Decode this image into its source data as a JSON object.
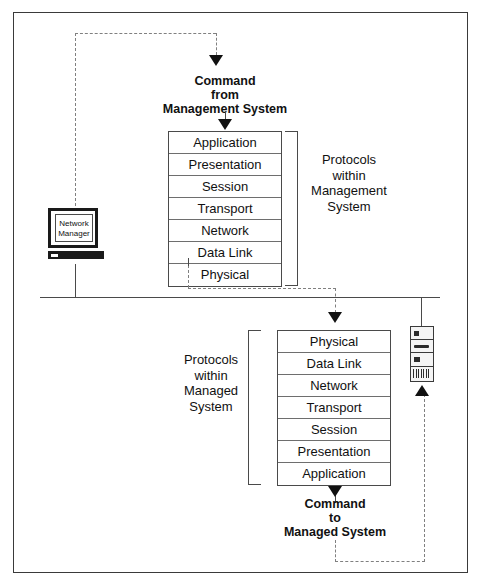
{
  "diagram": {
    "colors": {
      "line": "#4a4a4a",
      "dashed": "#808080",
      "arrow": "#111111",
      "border": "#3a3a3a",
      "text": "#111111",
      "background": "#ffffff"
    },
    "command_from": "Command\nfrom\nManagement System",
    "command_to": "Command\nto\nManaged System",
    "label_management": "Protocols\nwithin\nManagement\nSystem",
    "label_managed": "Protocols\nwithin\nManaged\nSystem",
    "network_manager": {
      "label": "Network\nManager",
      "icon": "workstation-monitor-icon"
    },
    "managed_device": {
      "icon": "server-tower-icon"
    },
    "stack_upper": {
      "name": "Management System protocol stack",
      "layers": [
        "Application",
        "Presentation",
        "Session",
        "Transport",
        "Network",
        "Data Link",
        "Physical"
      ]
    },
    "stack_lower": {
      "name": "Managed System protocol stack",
      "layers": [
        "Physical",
        "Data Link",
        "Network",
        "Transport",
        "Session",
        "Presentation",
        "Application"
      ]
    }
  }
}
